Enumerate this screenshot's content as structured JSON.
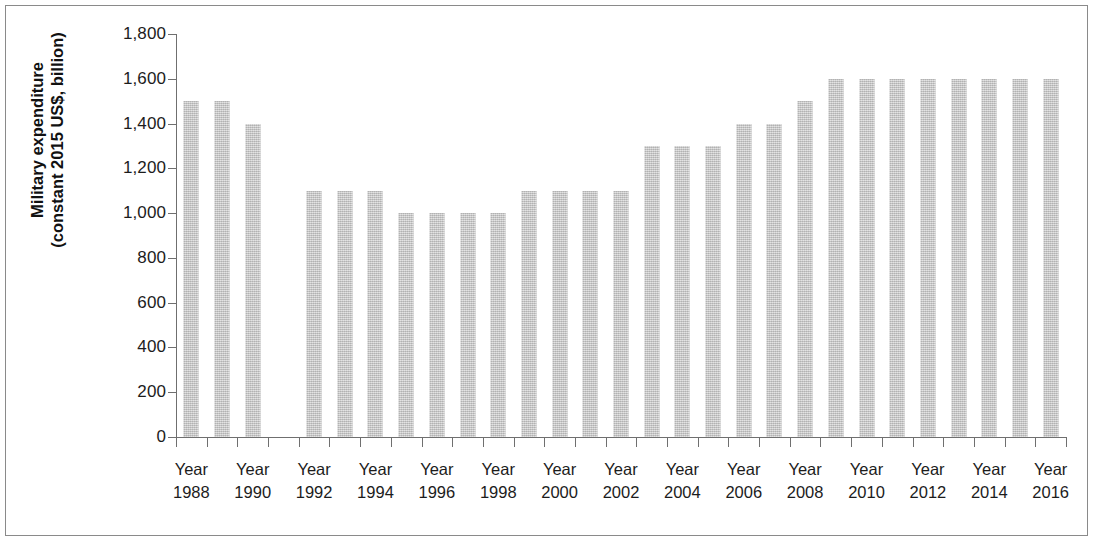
{
  "chart_data": {
    "type": "bar",
    "title": "",
    "subtitle": "",
    "xlabel": "",
    "ylabel": "Military expenditure\n(constant 2015 US$, billion)",
    "ylabel_line1": "Military expenditure",
    "ylabel_line2": "(constant 2015 US$, billion)",
    "ylim": [
      0,
      1800
    ],
    "y_tick_step": 200,
    "y_ticks": [
      0,
      200,
      400,
      600,
      800,
      1000,
      1200,
      1400,
      1600,
      1800
    ],
    "y_tick_labels": [
      "0",
      "200",
      "400",
      "600",
      "800",
      "1,000",
      "1,200",
      "1,400",
      "1,600",
      "1,800"
    ],
    "grid": false,
    "legend": null,
    "x_tick_label_prefix": "Year",
    "x_tick_labels": [
      "Year 1988",
      "Year 1990",
      "Year 1992",
      "Year 1994",
      "Year 1996",
      "Year 1998",
      "Year 2000",
      "Year 2002",
      "Year 2004",
      "Year 2006",
      "Year 2008",
      "Year 2010",
      "Year 2012",
      "Year 2014",
      "Year 2016"
    ],
    "x_tick_years": [
      1988,
      1990,
      1992,
      1994,
      1996,
      1998,
      2000,
      2002,
      2004,
      2006,
      2008,
      2010,
      2012,
      2014,
      2016
    ],
    "categories": [
      1988,
      1989,
      1990,
      1991,
      1992,
      1993,
      1994,
      1995,
      1996,
      1997,
      1998,
      1999,
      2000,
      2001,
      2002,
      2003,
      2004,
      2005,
      2006,
      2007,
      2008,
      2009,
      2010,
      2011,
      2012,
      2013,
      2014,
      2015,
      2016
    ],
    "values": [
      1500,
      1500,
      1400,
      null,
      1100,
      1100,
      1100,
      1000,
      1000,
      1000,
      1000,
      1100,
      1100,
      1100,
      1100,
      1300,
      1300,
      1300,
      1400,
      1400,
      1500,
      1600,
      1600,
      1600,
      1600,
      1600,
      1600,
      1600,
      1600
    ],
    "bar_color": "#c6c6c6",
    "axis_color": "#6f6f6f",
    "text_color": "#1c1c1c"
  },
  "figure": {
    "frame_color": "#8a8a8a",
    "background": "#ffffff"
  }
}
